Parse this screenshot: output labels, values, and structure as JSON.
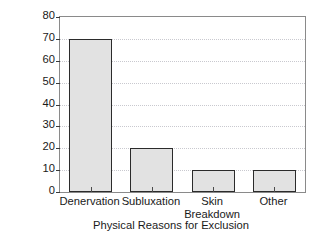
{
  "chart_data": {
    "type": "bar",
    "title": "",
    "xlabel": "Physical Reasons for Exclusion",
    "ylabel": "% Group Failing Physical Exam",
    "categories": [
      "Denervation",
      "Subluxation",
      "Skin Breakdown",
      "Other"
    ],
    "category_lines": [
      [
        "Denervation"
      ],
      [
        "Subluxation"
      ],
      [
        "Skin",
        "Breakdown"
      ],
      [
        "Other"
      ]
    ],
    "values": [
      70,
      20,
      10,
      10
    ],
    "ylim": [
      0,
      80
    ],
    "ytick_step": 10,
    "yticks": [
      0,
      10,
      20,
      30,
      40,
      50,
      60,
      70,
      80
    ],
    "ytick_labels": [
      "0",
      "10",
      "20",
      "30",
      "40",
      "50",
      "60",
      "70",
      "80"
    ],
    "grid": true,
    "grid_axis": "y",
    "legend": false,
    "legend_position": "none",
    "colors": {
      "bar_fill": "#e2e2e2",
      "bar_edge": "#2b2b2b",
      "gridline": "#c9c9cf",
      "frame": "#8a8a8a",
      "text": "#1a1a1a",
      "background": "#ffffff"
    }
  }
}
